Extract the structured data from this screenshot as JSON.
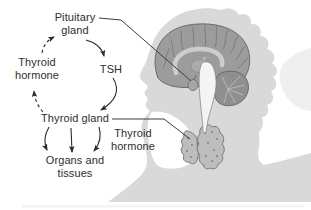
{
  "diagram": {
    "type": "physiology feedback diagram",
    "labels": {
      "pituitary_gland": "Pituitary\ngland",
      "tsh": "TSH",
      "thyroid_hormone_feedback": "Thyroid\nhormone",
      "thyroid_gland": "Thyroid gland",
      "thyroid_hormone_secreted": "Thyroid\nhormone",
      "organs_and_tissues": "Organs and\ntissues"
    },
    "flows": [
      {
        "from": "Pituitary gland",
        "to": "TSH",
        "style": "solid-arrow"
      },
      {
        "from": "TSH",
        "to": "Thyroid gland",
        "style": "solid-arrow"
      },
      {
        "from": "Thyroid gland",
        "to": "Organs and tissues",
        "style": "three-solid-arrows"
      },
      {
        "from": "Thyroid gland",
        "to": "Thyroid hormone (feedback)",
        "style": "dashed-arrow"
      },
      {
        "from": "Thyroid hormone (feedback)",
        "to": "Pituitary gland",
        "style": "dashed-arrow"
      }
    ],
    "illustration": {
      "silhouette": "human head and shoulders in profile facing left",
      "brain": "sagittal brain section, pointer line from Pituitary gland label",
      "thyroid": "butterfly-shaped thyroid gland in neck, pointer line from Thyroid gland label"
    },
    "colors": {
      "background": "#ffffff",
      "silhouette": "#d9d9d9",
      "silhouette_echo": "#efefef",
      "brain_fill": "#9c9c9c",
      "brain_outline": "#636363",
      "corpus_callosum": "#cdcdcd",
      "cerebellum": "#8f8f8f",
      "brainstem": "#f4f4f4",
      "thyroid_fill": "#bdbdbd",
      "thyroid_outline": "#707070",
      "text": "#2e2e2e",
      "arrow": "#2b2b2b"
    }
  }
}
